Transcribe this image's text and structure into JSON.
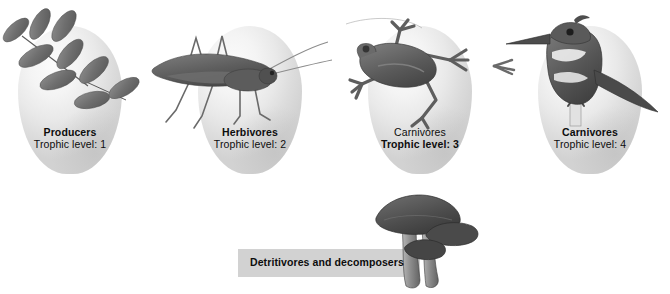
{
  "figure": {
    "background_color": "#ffffff",
    "oval_color": "#e9e9e9",
    "label_box_color": "#d2d2d2",
    "text_color": "#0d0d0d"
  },
  "trophic_groups": [
    {
      "name": "Producers",
      "level_label": "Trophic level: 1",
      "level": 1,
      "name_weight": "bold",
      "level_weight": "regular",
      "organism": "compound-leaf",
      "organism_icon": "leaf-icon"
    },
    {
      "name": "Herbivores",
      "level_label": "Trophic level: 2",
      "level": 2,
      "name_weight": "bold",
      "level_weight": "regular",
      "organism": "katydid",
      "organism_icon": "grasshopper-icon"
    },
    {
      "name": "Carnivores",
      "level_label": "Trophic level: 3",
      "level": 3,
      "name_weight": "regular",
      "level_weight": "bold",
      "organism": "frog",
      "organism_icon": "frog-icon"
    },
    {
      "name": "Carnivores",
      "level_label": "Trophic level: 4",
      "level": 4,
      "name_weight": "bold",
      "level_weight": "regular",
      "organism": "kingfisher",
      "organism_icon": "bird-icon"
    }
  ],
  "detritivores": {
    "label": "Detritivores and decomposers",
    "organism": "mushrooms",
    "organism_icon": "mushroom-icon"
  }
}
